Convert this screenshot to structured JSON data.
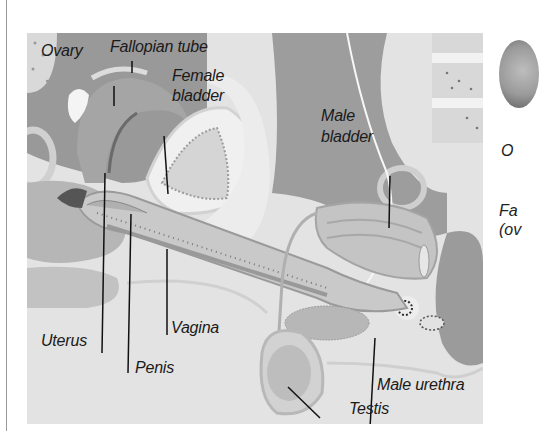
{
  "figure": {
    "labels": {
      "ovary": "Ovary",
      "fallopian_tube": "Fallopian tube",
      "female_bladder_line1": "Female",
      "female_bladder_line2": "bladder",
      "male_bladder_line1": "Male",
      "male_bladder_line2": "bladder",
      "uterus": "Uterus",
      "penis": "Penis",
      "vagina": "Vagina",
      "male_urethra": "Male urethra",
      "testis": "Testis"
    },
    "colors": {
      "background": "#e6e6e6",
      "dark_tissue": "#8f8f8f",
      "mid_tissue": "#b4b4b4",
      "light_tissue": "#d6d6d6",
      "leader_line": "#111111",
      "label_text": "#1a1a1a"
    }
  },
  "side_panel": {
    "partial_label_1": "O",
    "partial_label_2_line1": "Fa",
    "partial_label_2_line2": "(ov"
  }
}
